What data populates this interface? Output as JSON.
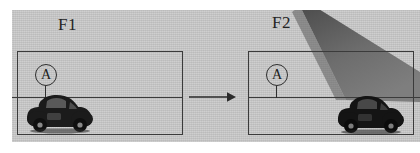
{
  "figure": {
    "background_color": "#c6c6c6",
    "ink_color": "#3b3b3b"
  },
  "panels": [
    {
      "id": "F1",
      "label": "F1",
      "marker": {
        "label": "A",
        "shape": "circle-with-stem"
      },
      "has_car": true,
      "has_beam": false,
      "horizon": true
    },
    {
      "id": "F2",
      "label": "F2",
      "marker": {
        "label": "A",
        "shape": "circle-with-stem"
      },
      "has_car": true,
      "has_beam": true,
      "horizon": true
    }
  ],
  "arrow": {
    "direction": "right",
    "name": "transition-arrow",
    "color": "#2b2b2b"
  },
  "beam": {
    "name": "shadow-beam",
    "description": "dark wedge from top converging toward the vehicle",
    "color": "#6a6a6a"
  },
  "car": {
    "name": "vehicle",
    "description": "vintage beetle-style car silhouette",
    "color": "#1e1e1e"
  }
}
